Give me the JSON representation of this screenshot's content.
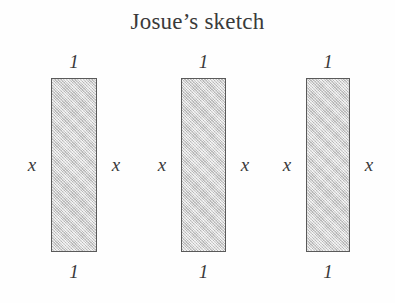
{
  "title": "Josue’s sketch",
  "figure": {
    "fill_color": "#d2d2d2",
    "stroke_color": "#5a5a5a",
    "text_color": "#3a3a3a",
    "background_color": "#fefefe",
    "rectangles": [
      {
        "name": "rectangle-1",
        "top_label": "1",
        "bottom_label": "1",
        "left_label": "x",
        "right_label": "x"
      },
      {
        "name": "rectangle-2",
        "top_label": "1",
        "bottom_label": "1",
        "left_label": "x",
        "right_label": "x"
      },
      {
        "name": "rectangle-3",
        "top_label": "1",
        "bottom_label": "1",
        "left_label": "x",
        "right_label": "x"
      }
    ]
  }
}
